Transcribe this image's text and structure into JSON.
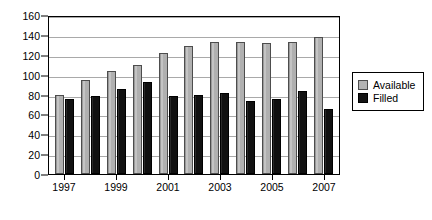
{
  "chart_data": {
    "type": "bar",
    "title": "",
    "subtitle": "",
    "xlabel": "",
    "ylabel": "",
    "categories": [
      "1997",
      "1998",
      "1999",
      "2000",
      "2001",
      "2002",
      "2003",
      "2004",
      "2005",
      "2006",
      "2007"
    ],
    "tick_labels": [
      "1997",
      "",
      "1999",
      "",
      "2001",
      "",
      "2003",
      "",
      "2005",
      "",
      "2007"
    ],
    "series": [
      {
        "name": "Available",
        "color": "#b3b3b3",
        "values": [
          81,
          96,
          105,
          111,
          123,
          130,
          135,
          135,
          134,
          135,
          140
        ]
      },
      {
        "name": "Filled",
        "color": "#141414",
        "values": [
          76,
          80,
          87,
          94,
          79,
          81,
          83,
          74,
          76,
          85,
          66
        ]
      }
    ],
    "ylim": [
      0,
      160
    ],
    "yticks": [
      0,
      20,
      40,
      60,
      80,
      100,
      120,
      140,
      160
    ],
    "ytick_labels": [
      "0",
      "20",
      "40",
      "60",
      "80",
      "100",
      "120",
      "140",
      "160"
    ],
    "grid": true,
    "grid_axis": "y",
    "legend_position": "right",
    "legend_entries": [
      "Available",
      "Filled"
    ]
  },
  "legend": {
    "items": [
      {
        "label": "Available",
        "swatch": "available"
      },
      {
        "label": "Filled",
        "swatch": "filled"
      }
    ]
  }
}
